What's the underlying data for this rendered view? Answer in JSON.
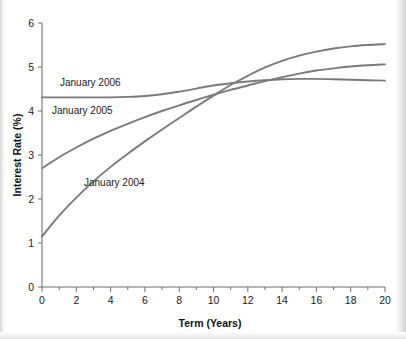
{
  "chart_data": {
    "type": "line",
    "title": "",
    "xlabel": "Term (Years)",
    "ylabel": "Interest Rate (%)",
    "xlim": [
      0,
      20
    ],
    "ylim": [
      0,
      6
    ],
    "xticks": [
      0,
      2,
      4,
      6,
      8,
      10,
      12,
      14,
      16,
      18,
      20
    ],
    "xtick_labels": [
      "0",
      "2",
      "4",
      "6",
      "8",
      "10",
      "12",
      "14",
      "16",
      "18",
      "20"
    ],
    "xminor_ticks": [
      1,
      3,
      5,
      7,
      9,
      11,
      13,
      15,
      17,
      19
    ],
    "yticks": [
      0,
      1,
      2,
      3,
      4,
      5,
      6
    ],
    "ytick_labels": [
      "0",
      "1",
      "2",
      "3",
      "4",
      "5",
      "6"
    ],
    "grid": false,
    "legend_position": "inline-annotations",
    "line_color": "#7a7a7a",
    "x": [
      0,
      1,
      2,
      3,
      4,
      5,
      6,
      7,
      8,
      9,
      10,
      11,
      12,
      13,
      14,
      15,
      16,
      17,
      18,
      19,
      20
    ],
    "series": [
      {
        "name": "January 2004",
        "label": "January 2004",
        "color": "#7a7a7a",
        "values": [
          1.15,
          1.62,
          2.03,
          2.4,
          2.73,
          3.03,
          3.31,
          3.58,
          3.84,
          4.1,
          4.35,
          4.59,
          4.8,
          4.99,
          5.14,
          5.26,
          5.35,
          5.42,
          5.47,
          5.5,
          5.52
        ]
      },
      {
        "name": "January 2005",
        "label": "January 2005",
        "color": "#7a7a7a",
        "values": [
          2.7,
          2.95,
          3.17,
          3.37,
          3.55,
          3.71,
          3.86,
          4.0,
          4.13,
          4.25,
          4.37,
          4.48,
          4.58,
          4.68,
          4.77,
          4.85,
          4.92,
          4.97,
          5.01,
          5.04,
          5.06
        ]
      },
      {
        "name": "January 2006",
        "label": "January 2006",
        "color": "#7a7a7a",
        "values": [
          4.31,
          4.31,
          4.31,
          4.31,
          4.31,
          4.32,
          4.34,
          4.38,
          4.44,
          4.51,
          4.58,
          4.63,
          4.67,
          4.7,
          4.72,
          4.73,
          4.73,
          4.72,
          4.71,
          4.7,
          4.69
        ]
      }
    ],
    "annotations": [
      {
        "text": "January 2006",
        "x_px": 60,
        "y_px": 86
      },
      {
        "text": "January 2005",
        "x_px": 52,
        "y_px": 114
      },
      {
        "text": "January 2004",
        "x_px": 84,
        "y_px": 186
      }
    ]
  }
}
